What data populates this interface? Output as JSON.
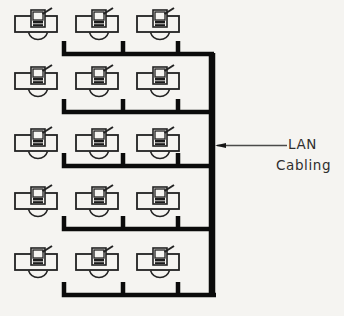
{
  "diagram": {
    "callout": {
      "line1": "LAN",
      "line2": "Cabling"
    },
    "workstations": {
      "rows": 5,
      "columns": 3,
      "count": 15
    },
    "colors": {
      "background": "#f5f4f1",
      "line": "#222222",
      "cable": "#0b0b0b",
      "arrow_line": "#4a4a4a",
      "text": "#2e2e2e"
    }
  }
}
